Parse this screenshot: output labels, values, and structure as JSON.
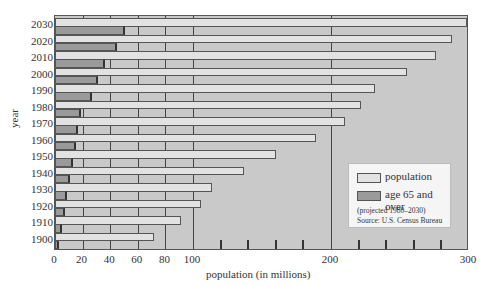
{
  "chart_data": {
    "type": "bar",
    "orientation": "horizontal",
    "title": "",
    "xlabel": "population (in millions)",
    "ylabel": "year",
    "xlim": [
      0,
      300
    ],
    "x_tick_labels": [
      "0",
      "20",
      "40",
      "60",
      "80",
      "100",
      "200",
      "300"
    ],
    "x_gridlines": [
      20,
      40,
      60,
      80,
      100,
      200
    ],
    "x_minor_ticks": [
      120,
      140,
      160,
      180,
      220,
      240,
      260,
      280
    ],
    "categories": [
      "2030",
      "2020",
      "2010",
      "2000",
      "1990",
      "1980",
      "1970",
      "1960",
      "1950",
      "1940",
      "1930",
      "1920",
      "1910",
      "1900"
    ],
    "series": [
      {
        "name": "population",
        "color": "#e2e2e2",
        "values": [
          302,
          288,
          276,
          255,
          232,
          222,
          210,
          189,
          160,
          137,
          114,
          106,
          91,
          72
        ]
      },
      {
        "name": "age 65 and over",
        "color": "#9a9a9a",
        "values": [
          51,
          45,
          36,
          31,
          27,
          19,
          17,
          15.5,
          13,
          11,
          9,
          7,
          5,
          3
        ]
      }
    ],
    "legend": {
      "position": "lower right",
      "entries": [
        "population",
        "age 65 and over"
      ],
      "notes": [
        "(projected 1980–2030)",
        "Source: U.S. Census Bureau"
      ]
    },
    "grid": true
  },
  "labels": {
    "xlabel": "population (in millions)",
    "ylabel": "year",
    "legend_population": "population",
    "legend_age": "age 65 and over",
    "note1": "(projected 1980–2030)",
    "note2": "Source: U.S. Census Bureau"
  }
}
